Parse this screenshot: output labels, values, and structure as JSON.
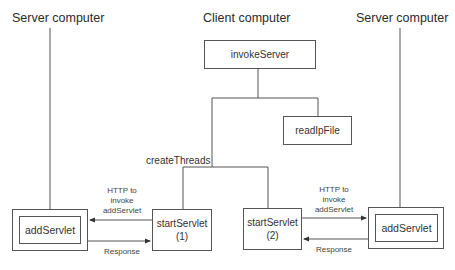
{
  "diagram": {
    "left_server": {
      "title": "Server computer",
      "component": "addServlet"
    },
    "client": {
      "title": "Client computer"
    },
    "right_server": {
      "title": "Server computer",
      "component": "addServlet"
    },
    "nodes": {
      "invoke_server": "invokeServer",
      "read_ip_file": "readIpFile",
      "create_threads": "createThreads",
      "start_servlet_1": {
        "name": "startServlet",
        "index": "(1)"
      },
      "start_servlet_2": {
        "name": "startServlet",
        "index": "(2)"
      }
    },
    "edges": {
      "left_request": {
        "line1": "HTTP to",
        "line2": "invoke",
        "line3": "addServlet"
      },
      "left_response": "Response",
      "right_request": {
        "line1": "HTTP to",
        "line2": "invoke",
        "line3": "addServlet"
      },
      "right_response": "Response"
    },
    "colors": {
      "line": "#555555",
      "text": "#333333",
      "background": "#ffffff"
    }
  }
}
